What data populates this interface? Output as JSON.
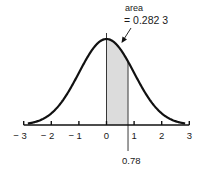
{
  "chart_data": {
    "type": "area",
    "title": "",
    "xlabel": "",
    "ylabel": "",
    "xlim": [
      -3,
      3
    ],
    "x_ticks": [
      -3,
      -2,
      -1,
      0,
      1,
      2,
      3
    ],
    "x_tick_labels": [
      "− 3",
      "− 2",
      "− 1",
      "0",
      "1",
      "2",
      "3"
    ],
    "curve": "standard normal density",
    "shaded_region": {
      "from": 0,
      "to": 0.78
    },
    "annotations": {
      "area_label": "area",
      "area_value": "= 0.282 3",
      "marker_label": "0.78"
    },
    "grid": false,
    "legend": "none",
    "colors": {
      "curve": "#111111",
      "shade": "#dcdcdc",
      "axis": "#111111"
    }
  }
}
